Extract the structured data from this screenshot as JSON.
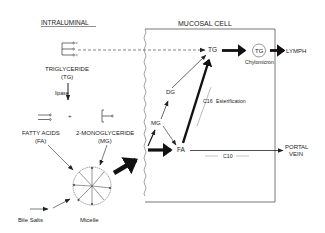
{
  "diagram": {
    "type": "biochemical pathway",
    "sections": {
      "intraluminal": "INTRALUMINAL",
      "mucosal_cell": "MUCOSAL CELL"
    },
    "nodes": {
      "triglyceride_line1": "TRIGLYCERIDE",
      "triglyceride_line2": "(TG)",
      "lipase": "lipase",
      "fatty_acids_line1": "FATTY ACIDS",
      "fatty_acids_line2": "(FA)",
      "plus": "+",
      "monoglyceride_line1": "2-MONOGLYCERIDE",
      "monoglyceride_line2": "(MG)",
      "bile_salts": "Bile Salts",
      "micelle": "Micelle",
      "cell_tg": "TG",
      "cell_dg": "DG",
      "cell_mg": "MG",
      "cell_fa": "FA",
      "chylomicron_tg": "TG",
      "chylomicron": "Chylomicron",
      "lymph": "LYMPH",
      "portal_line1": "PORTAL",
      "portal_line2": "VEIN"
    },
    "annotations": {
      "c16": "C16",
      "esterification": "Esterification",
      "c10": "C10"
    },
    "edges": [
      {
        "from": "Triglyceride (TG)",
        "to": "Mucosal TG",
        "style": "dashed"
      },
      {
        "from": "Triglyceride (TG)",
        "to": "Fatty acids + 2-Monoglyceride",
        "label": "lipase"
      },
      {
        "from": "Fatty acids (FA)",
        "to": "Micelle"
      },
      {
        "from": "2-Monoglyceride (MG)",
        "to": "Micelle"
      },
      {
        "from": "Bile Salts",
        "to": "Micelle"
      },
      {
        "from": "Micelle",
        "to": "Mucosal cell",
        "style": "bold"
      },
      {
        "from": "Mucosal entry",
        "to": "MG"
      },
      {
        "from": "Mucosal entry",
        "to": "FA",
        "style": "bold"
      },
      {
        "from": "MG",
        "to": "DG"
      },
      {
        "from": "MG",
        "to": "FA"
      },
      {
        "from": "DG",
        "to": "TG"
      },
      {
        "from": "FA",
        "to": "TG",
        "label": "C16 Esterification",
        "style": "bold"
      },
      {
        "from": "TG",
        "to": "Chylomicron TG",
        "style": "bold"
      },
      {
        "from": "Chylomicron TG",
        "to": "LYMPH",
        "style": "bold"
      },
      {
        "from": "FA",
        "to": "PORTAL VEIN",
        "label": "C10"
      }
    ]
  }
}
